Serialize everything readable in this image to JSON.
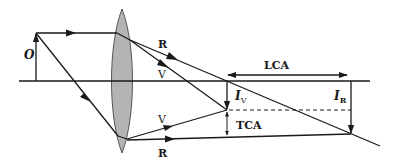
{
  "figure": {
    "object_label": "O",
    "ray_labels": {
      "red_top": "R",
      "violet_top": "V",
      "violet_bottom": "V",
      "red_bottom": "R"
    },
    "image_labels": {
      "violet": {
        "main": "I",
        "sub": "V"
      },
      "red": {
        "main": "I",
        "sub": "R"
      }
    },
    "dimension_labels": {
      "longitudinal": "LCA",
      "transverse": "TCA"
    },
    "colors": {
      "line": "#1a1a1a",
      "lens_fill": "#b4b4b4",
      "lens_stroke": "#555555",
      "background": "#ffffff"
    }
  }
}
